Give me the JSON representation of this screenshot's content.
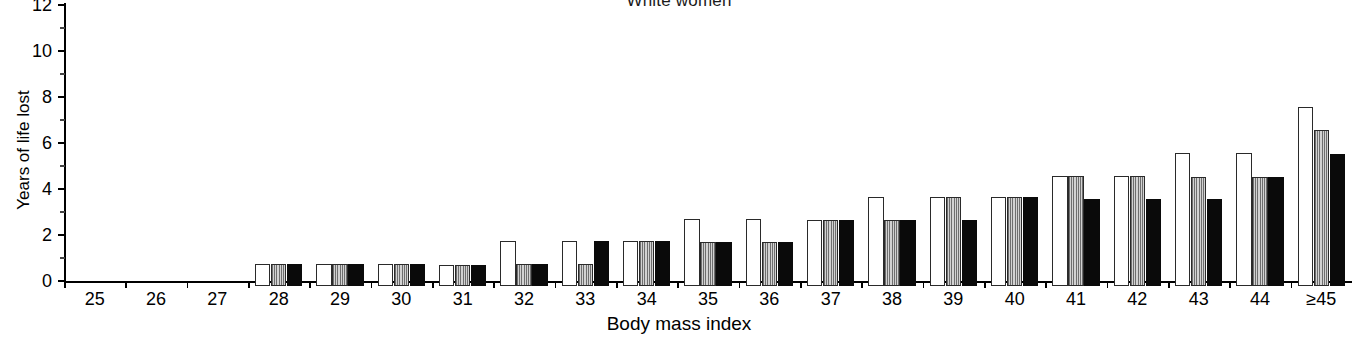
{
  "chart_data": {
    "type": "bar",
    "title": "White women",
    "xlabel": "Body mass index",
    "ylabel": "Years of life lost",
    "ylim": [
      0,
      12
    ],
    "ytick_values": [
      0,
      2,
      4,
      6,
      8,
      10,
      12
    ],
    "ytick_labels": [
      "0",
      "2",
      "4",
      "6",
      "8",
      "10",
      "12"
    ],
    "yminor_values": [
      1,
      3,
      5,
      7,
      9,
      11
    ],
    "grid": false,
    "legend": "none",
    "categories": [
      "25",
      "26",
      "27",
      "28",
      "29",
      "30",
      "31",
      "32",
      "33",
      "34",
      "35",
      "36",
      "37",
      "38",
      "39",
      "40",
      "41",
      "42",
      "43",
      "44",
      "≥45"
    ],
    "series": [
      {
        "name": "white",
        "values": [
          0,
          0,
          0,
          0.95,
          0.95,
          0.95,
          0.9,
          1.95,
          1.95,
          1.95,
          2.9,
          2.9,
          2.85,
          3.85,
          3.85,
          3.85,
          4.8,
          4.8,
          5.8,
          5.8,
          7.8
        ]
      },
      {
        "name": "gray",
        "values": [
          0,
          0,
          0,
          0.95,
          0.95,
          0.95,
          0.9,
          0.95,
          0.95,
          1.95,
          1.9,
          1.9,
          2.85,
          2.85,
          3.85,
          3.85,
          4.8,
          4.8,
          4.75,
          4.75,
          6.8
        ]
      },
      {
        "name": "black",
        "values": [
          0,
          0,
          0,
          0.95,
          0.95,
          0.95,
          0.9,
          0.95,
          1.95,
          1.95,
          1.9,
          1.9,
          2.85,
          2.85,
          2.85,
          3.85,
          3.8,
          3.8,
          3.8,
          4.75,
          5.75
        ]
      }
    ]
  }
}
